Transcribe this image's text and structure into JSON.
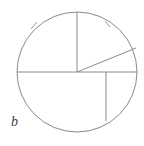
{
  "figure": {
    "label": "b",
    "caption_position": "bottom-left",
    "background_color": "#ffffff",
    "stroke_color": "#8a8a8a",
    "label_color": "#3d3d3d",
    "stroke_width": 1
  },
  "chart_data": {
    "type": "diagram",
    "subtype": "circle-sector-partition",
    "title": "b",
    "xlabel": "",
    "ylabel": "",
    "canvas": {
      "width": 144,
      "height": 146
    },
    "circle": {
      "center_x": 77,
      "center_y": 72,
      "radius": 60,
      "stroke": "#8a8a8a"
    },
    "segments": [
      {
        "name": "horizontal-diameter",
        "kind": "chord",
        "x1": 17,
        "y1": 72,
        "x2": 137,
        "y2": 72,
        "stroke": "#8a8a8a"
      },
      {
        "name": "vertical-upper-radius",
        "kind": "radius",
        "x1": 77,
        "y1": 72,
        "x2": 77,
        "y2": 12,
        "stroke": "#8a8a8a"
      },
      {
        "name": "slanted-upper-right-radius",
        "kind": "radius",
        "x1": 77,
        "y1": 72,
        "x2": 136,
        "y2": 48,
        "stroke": "#8a8a8a"
      },
      {
        "name": "vertical-lower-chord",
        "kind": "chord",
        "x1": 106,
        "y1": 72,
        "x2": 106,
        "y2": 121,
        "stroke": "#8a8a8a"
      }
    ],
    "tick_marks": [
      {
        "name": "arc-tick-upper-left",
        "angle_deg": 140,
        "x1": 31,
        "y1": 29,
        "x2": 37,
        "y2": 22,
        "stroke": "#9a9a9a"
      },
      {
        "name": "arc-tick-upper-right",
        "angle_deg": 62,
        "x1": 105,
        "y1": 21,
        "x2": 110,
        "y2": 27,
        "stroke": "#9a9a9a"
      }
    ],
    "regions": [
      {
        "name": "upper-left-quadrant",
        "description": "sector between vertical upper radius and left end of diameter"
      },
      {
        "name": "upper-right-upper-sector",
        "description": "sector between vertical upper radius and slanted radius"
      },
      {
        "name": "upper-right-lower-sector",
        "description": "sector between slanted radius and right end of diameter"
      },
      {
        "name": "lower-left-region",
        "description": "region below diameter left of vertical lower chord"
      },
      {
        "name": "lower-right-region",
        "description": "region below diameter right of vertical lower chord"
      }
    ],
    "grid": false,
    "legend": null
  }
}
